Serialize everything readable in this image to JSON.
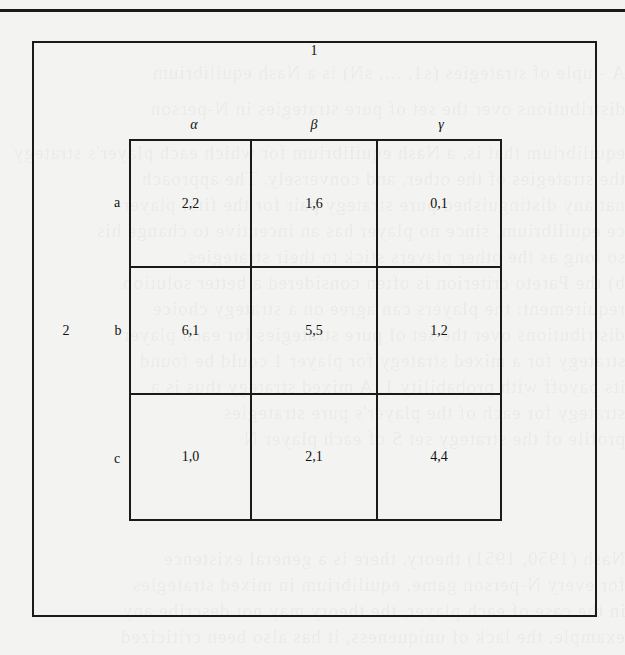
{
  "figure": {
    "type": "normal-form game payoff matrix",
    "player_column_label": "1",
    "player_row_label": "2",
    "column_strategies": [
      "α",
      "β",
      "γ"
    ],
    "row_strategies": [
      "a",
      "b",
      "c"
    ],
    "payoffs": [
      [
        "2,2",
        "1,6",
        "0,1"
      ],
      [
        "6,1",
        "5,5",
        "1,2"
      ],
      [
        "1,0",
        "2,1",
        "4,4"
      ]
    ]
  },
  "bleed_through_text": [
    "A  -tuple of strategies (s1, ..., sN) is a Nash equilibrium",
    "distributions over the set of pure strategies in N-person",
    "equilibrium that is, a Nash equilibrium for which each player's strategy",
    "the strategies of the other, and conversely. The approach",
    "nat any distinguished pure strategy pair for the first player",
    "ce equilibrium, since no player has an incentive to change his",
    "so long as the other players stick to their strategies.",
    "b) the Pareto criterion is often considered a better solution",
    "requirement: the players can agree on a strategy choice",
    "distributions over the set of pure strategies for each player",
    "strategy for a mixed strategy for player 1 could be found",
    "its payoff with probability 1. A mixed strategy thus is a",
    "strategy for each of the player's pure strategies",
    "profile of the strategy set S of each player N",
    "",
    "Nash (1950, 1951) theory, there is a general existence",
    "for every N-person game, equilibrium in mixed strategies",
    "in the case of each player, the theory may not describe any",
    "example, the lack of uniqueness, it has also been criticized"
  ]
}
